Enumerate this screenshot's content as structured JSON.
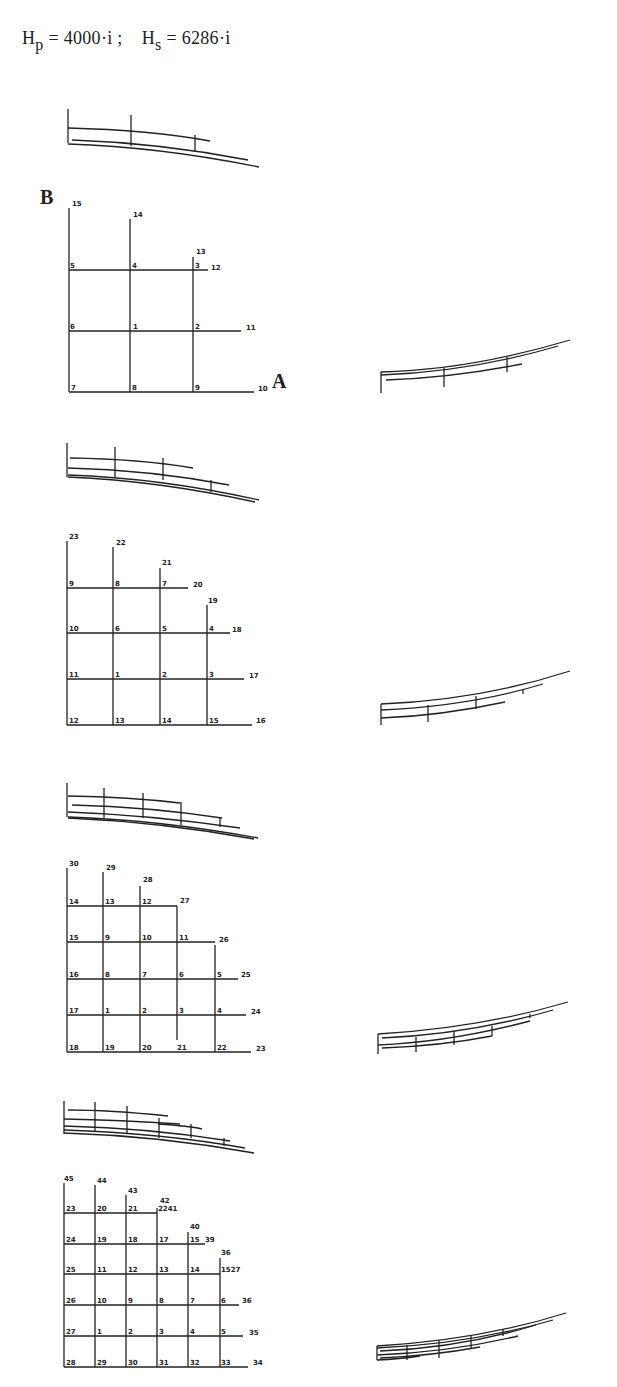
{
  "formula": {
    "hp_symbol": "H",
    "hp_sub": "p",
    "hp_value": "= 4000·i ;",
    "hs_symbol": "H",
    "hs_sub": "s",
    "hs_value": "= 6286·i"
  },
  "figure1": {
    "label_B": "B",
    "label_A": "A",
    "node_labels": [
      "15",
      "14",
      "13",
      "12",
      "5",
      "4",
      "3",
      "6",
      "1",
      "2",
      "11",
      "7",
      "8",
      "9",
      "10"
    ]
  },
  "figure2": {
    "node_labels": [
      "23",
      "22",
      "21",
      "20",
      "19",
      "18",
      "9",
      "8",
      "7",
      "10",
      "6",
      "5",
      "4",
      "11",
      "1",
      "2",
      "3",
      "17",
      "12",
      "13",
      "14",
      "15",
      "16"
    ]
  },
  "figure3": {
    "node_labels": [
      "30",
      "29",
      "28",
      "27",
      "26",
      "25",
      "24",
      "23",
      "14",
      "13",
      "12",
      "15",
      "9",
      "10",
      "11",
      "16",
      "8",
      "7",
      "6",
      "5",
      "17",
      "1",
      "2",
      "3",
      "4",
      "18",
      "19",
      "20",
      "21",
      "22"
    ]
  },
  "figure4": {
    "node_labels": [
      "45",
      "44",
      "43",
      "42",
      "41",
      "40",
      "39",
      "38",
      "37",
      "36",
      "35",
      "34",
      "23",
      "20",
      "21",
      "22",
      "24",
      "19",
      "18",
      "17",
      "15",
      "25",
      "11",
      "12",
      "13",
      "14",
      "16",
      "26",
      "10",
      "9",
      "8",
      "7",
      "6",
      "27",
      "1",
      "2",
      "3",
      "4",
      "5",
      "28",
      "29",
      "30",
      "31",
      "32",
      "33"
    ]
  }
}
